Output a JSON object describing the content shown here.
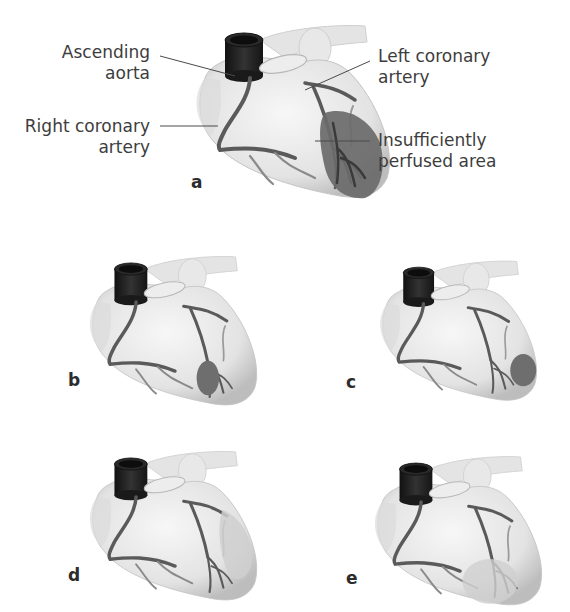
{
  "figure": {
    "labels": {
      "ascending_aorta": [
        "Ascending",
        "aorta"
      ],
      "right_coronary_artery": [
        "Right coronary",
        "artery"
      ],
      "left_coronary_artery": [
        "Left coronary",
        "artery"
      ],
      "insufficiently_perfused_area": [
        "Insufficiently",
        "perfused area"
      ]
    },
    "panels": [
      {
        "letter": "a",
        "description": "Occlusion with large insufficiently perfused area at left ventricular wall"
      },
      {
        "letter": "b",
        "description": "Small dark ischemic area at LAD branch"
      },
      {
        "letter": "c",
        "description": "Dark ischemic area at apex lateral wall"
      },
      {
        "letter": "d",
        "description": "Faint perfusion deficit along lateral wall"
      },
      {
        "letter": "e",
        "description": "Faint round perfusion deficit at apex"
      }
    ],
    "colors": {
      "heart_fill": "#e9e9e9",
      "heart_shadow": "#c8c8c8",
      "aorta": "#1e1e1e",
      "vessel": "#5a5a5a",
      "ischemic_dark": "#6a6a6a",
      "ischemic_light": "#cfcfcf",
      "leader_line": "#4a4a4a",
      "text": "#3d3d3d"
    }
  }
}
